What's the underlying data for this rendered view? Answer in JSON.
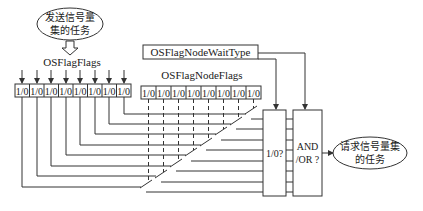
{
  "diagram": {
    "title": "",
    "sender_task": {
      "line1": "发送信号量",
      "line2": "集的任务"
    },
    "receiver_task": {
      "line1": "请求信号量集",
      "line2": "的任务"
    },
    "flag_group": {
      "label": "OSFlagFlags",
      "cells": [
        "1/0",
        "1/0",
        "1/0",
        "1/0",
        "1/0",
        "1/0",
        "1/0",
        "1/0"
      ]
    },
    "node_flags": {
      "label": "OSFlagNodeFlags",
      "cells": [
        "1/0",
        "1/0",
        "1/0",
        "1/0",
        "1/0",
        "1/0",
        "1/0",
        "1/0"
      ]
    },
    "wait_type": {
      "label": "OSFlagNodeWaitType"
    },
    "bit_compare_box": {
      "label": "1/0?"
    },
    "logic_box": {
      "line1": "AND",
      "line2": "/OR ?"
    },
    "colors": {
      "stroke": "#333333",
      "text": "#1a1a1a",
      "background": "#ffffff"
    }
  }
}
